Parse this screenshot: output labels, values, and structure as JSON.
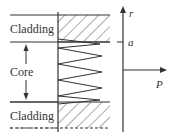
{
  "diagram": {
    "labels": {
      "cladding_top": "Cladding",
      "core": "Core",
      "cladding_bottom": "Cladding",
      "r_axis": "r",
      "a_marker": "a",
      "p_axis": "P"
    },
    "colors": {
      "line": "#333333",
      "hatch": "#555555",
      "background": "#ffffff"
    }
  }
}
